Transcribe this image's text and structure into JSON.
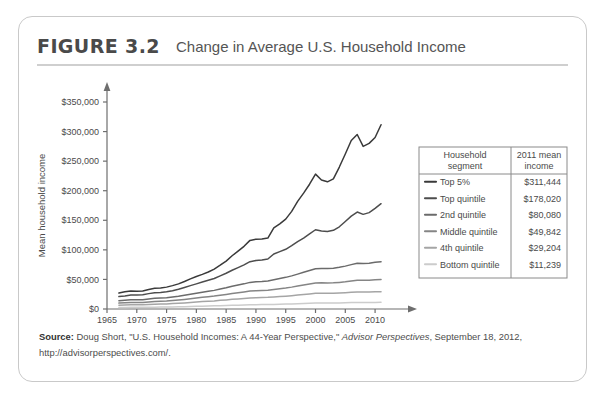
{
  "figure": {
    "number": "FIGURE 3.2",
    "title": "Change in Average U.S. Household Income"
  },
  "source": {
    "label": "Source:",
    "text_before_italic": " Doug Short, \"U.S. Household Incomes: A 44-Year Perspective,\" ",
    "italic": "Advisor Perspectives",
    "text_after_italic": ", September 18, 2012,",
    "line2": "http://advisorperspectives.com/."
  },
  "legend": {
    "header_segment": "Household segment",
    "header_income": "2011 mean income",
    "header_segment_line1": "Household",
    "header_segment_line2": "segment",
    "header_income_line1": "2011 mean",
    "header_income_line2": "income",
    "rows": [
      {
        "label": "Top 5%",
        "value": "$311,444",
        "color": "#3a3a3a"
      },
      {
        "label": "Top quintile",
        "value": "$178,020",
        "color": "#4d4d4d"
      },
      {
        "label": "2nd quintile",
        "value": "$80,080",
        "color": "#6b6b6b"
      },
      {
        "label": "Middle quintile",
        "value": "$49,842",
        "color": "#858585"
      },
      {
        "label": "4th quintile",
        "value": "$29,204",
        "color": "#a5a5a5"
      },
      {
        "label": "Bottom quintile",
        "value": "$11,239",
        "color": "#cccccc"
      }
    ]
  },
  "chart_data": {
    "type": "line",
    "title": "Change in Average U.S. Household Income",
    "xlabel": "Year",
    "ylabel": "Mean household income",
    "xlim": [
      1965,
      2012
    ],
    "ylim": [
      0,
      350000
    ],
    "xticks": [
      1965,
      1970,
      1975,
      1980,
      1985,
      1990,
      1995,
      2000,
      2005,
      2010
    ],
    "yticks": [
      0,
      50000,
      100000,
      150000,
      200000,
      250000,
      300000,
      350000
    ],
    "ytick_labels": [
      "$0",
      "$50,000",
      "$100,000",
      "$150,000",
      "$200,000",
      "$250,000",
      "$300,000",
      "$350,000"
    ],
    "grid": false,
    "legend_position": "right",
    "x": [
      1967,
      1968,
      1969,
      1970,
      1971,
      1972,
      1973,
      1974,
      1975,
      1976,
      1977,
      1978,
      1979,
      1980,
      1981,
      1982,
      1983,
      1984,
      1985,
      1986,
      1987,
      1988,
      1989,
      1990,
      1991,
      1992,
      1993,
      1994,
      1995,
      1996,
      1997,
      1998,
      1999,
      2000,
      2001,
      2002,
      2003,
      2004,
      2005,
      2006,
      2007,
      2008,
      2009,
      2010,
      2011
    ],
    "series": [
      {
        "name": "Top 5%",
        "color": "#3a3a3a",
        "values": [
          27000,
          29000,
          30500,
          30000,
          30500,
          33000,
          35000,
          35500,
          37000,
          39500,
          42500,
          46500,
          51000,
          55000,
          58500,
          62500,
          67500,
          74000,
          81000,
          90000,
          98000,
          106000,
          116000,
          118000,
          118500,
          120000,
          137000,
          144000,
          152000,
          165000,
          182000,
          196000,
          211000,
          228000,
          218000,
          215000,
          220000,
          240000,
          262000,
          285000,
          295000,
          275000,
          280000,
          290000,
          311444
        ]
      },
      {
        "name": "Top quintile",
        "color": "#4d4d4d",
        "values": [
          21000,
          22000,
          23500,
          23500,
          24000,
          26000,
          27500,
          28000,
          29000,
          31000,
          33500,
          36500,
          39500,
          42500,
          45500,
          48500,
          51500,
          56000,
          60500,
          65500,
          70000,
          74500,
          80000,
          82000,
          83000,
          84500,
          93000,
          97000,
          101000,
          107000,
          114000,
          120000,
          127000,
          134000,
          132000,
          131000,
          133000,
          139000,
          148000,
          157000,
          164000,
          160000,
          163000,
          170000,
          178020
        ]
      },
      {
        "name": "2nd quintile",
        "color": "#6b6b6b",
        "values": [
          14000,
          14800,
          15500,
          15500,
          15800,
          17000,
          18000,
          18500,
          19000,
          20200,
          21500,
          23200,
          25000,
          26800,
          28500,
          30000,
          31500,
          33800,
          36000,
          38500,
          40500,
          42500,
          45000,
          46000,
          46500,
          47500,
          49500,
          51500,
          53500,
          56000,
          59000,
          62000,
          65000,
          68000,
          68500,
          68500,
          69000,
          70500,
          72500,
          75000,
          77500,
          77000,
          77500,
          79000,
          80080
        ]
      },
      {
        "name": "Middle quintile",
        "color": "#858585",
        "values": [
          10000,
          10500,
          11000,
          11000,
          11200,
          12000,
          12700,
          13000,
          13400,
          14200,
          15100,
          16200,
          17400,
          18600,
          19800,
          20800,
          21800,
          23300,
          24700,
          26200,
          27500,
          28800,
          30300,
          31000,
          31300,
          31800,
          33000,
          34300,
          35500,
          37000,
          38800,
          40500,
          42200,
          44000,
          44200,
          44000,
          44200,
          45000,
          46000,
          47500,
          48800,
          48500,
          48800,
          49300,
          49842
        ]
      },
      {
        "name": "4th quintile",
        "color": "#a5a5a5",
        "values": [
          6500,
          6800,
          7100,
          7100,
          7200,
          7700,
          8100,
          8300,
          8600,
          9100,
          9700,
          10300,
          11100,
          11800,
          12500,
          13100,
          13700,
          14600,
          15400,
          16300,
          17100,
          17900,
          18800,
          19200,
          19400,
          19700,
          20300,
          21000,
          21700,
          22500,
          23500,
          24500,
          25500,
          26500,
          26700,
          26600,
          26700,
          27100,
          27600,
          28300,
          28900,
          28800,
          28900,
          29100,
          29204
        ]
      },
      {
        "name": "Bottom quintile",
        "color": "#cccccc",
        "values": [
          2600,
          2700,
          2800,
          2800,
          2850,
          3000,
          3150,
          3250,
          3350,
          3550,
          3750,
          4000,
          4300,
          4550,
          4800,
          5050,
          5300,
          5600,
          5900,
          6250,
          6550,
          6850,
          7200,
          7350,
          7400,
          7500,
          7750,
          8000,
          8300,
          8600,
          9000,
          9350,
          9700,
          10050,
          10150,
          10100,
          10150,
          10300,
          10500,
          10800,
          11000,
          10950,
          11000,
          11100,
          11239
        ]
      }
    ]
  }
}
